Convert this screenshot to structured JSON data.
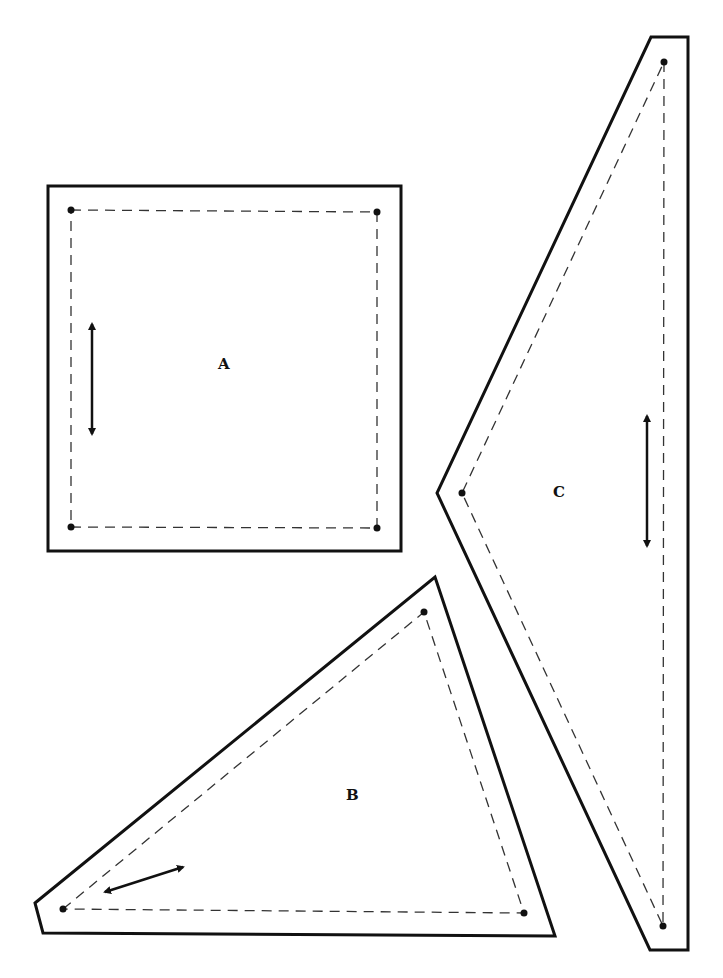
{
  "diagram": {
    "type": "quilt-pattern-templates",
    "colors": {
      "line": "#111111",
      "background": "#ffffff"
    },
    "pieces": [
      {
        "id": "A",
        "label": "A",
        "shape": "square",
        "grainline": "vertical"
      },
      {
        "id": "B",
        "label": "B",
        "shape": "triangle",
        "grainline": "diagonal"
      },
      {
        "id": "C",
        "label": "C",
        "shape": "triangle",
        "grainline": "vertical"
      }
    ],
    "legend": {
      "solid_line": "cutting line",
      "dashed_line": "sewing line",
      "dot": "matching point",
      "double_arrow": "grainline"
    }
  }
}
